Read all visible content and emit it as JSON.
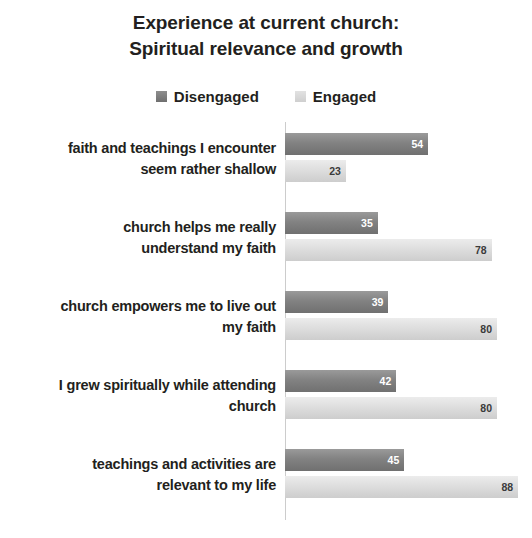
{
  "chart_data": {
    "type": "bar",
    "orientation": "horizontal",
    "title": "Experience at current church: Spiritual relevance and growth",
    "title_lines": [
      "Experience at current church:",
      "Spiritual relevance and growth"
    ],
    "xlabel": "",
    "ylabel": "",
    "xlim": [
      0,
      100
    ],
    "grid": false,
    "legend_position": "top-center",
    "colors": {
      "disengaged": "#808080",
      "engaged": "#d9d9d9",
      "text": "#231f20",
      "axis": "#cccccc",
      "background": "#ffffff"
    },
    "categories": [
      "faith and teachings I encounter seem rather shallow",
      "church helps me really understand my faith",
      "church empowers me to live out my faith",
      "I grew spiritually while attending church",
      "teachings and activities are relevant to my life"
    ],
    "category_lines": [
      [
        "faith and teachings I encounter",
        "seem rather shallow"
      ],
      [
        "church helps me really",
        "understand my faith"
      ],
      [
        "church empowers me to live out",
        "my faith"
      ],
      [
        "I grew spiritually while attending",
        "church"
      ],
      [
        "teachings and activities are",
        "relevant to my life"
      ]
    ],
    "series": [
      {
        "name": "Disengaged",
        "values": [
          54,
          35,
          39,
          42,
          45
        ]
      },
      {
        "name": "Engaged",
        "values": [
          23,
          78,
          80,
          80,
          88
        ]
      }
    ]
  },
  "legend": {
    "entries": [
      {
        "label": "Disengaged",
        "swatch": "dark-gray-swatch-icon"
      },
      {
        "label": "Engaged",
        "swatch": "light-gray-swatch-icon"
      }
    ]
  }
}
